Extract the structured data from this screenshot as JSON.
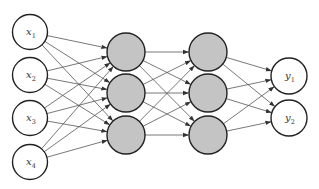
{
  "diagram": {
    "type": "feedforward-neural-network",
    "colors": {
      "background": "#ffffff",
      "edge": "#555555",
      "node_stroke": "#222222",
      "io_fill": "#ffffff",
      "hidden_fill": "#c4c4c4"
    },
    "layers": [
      {
        "name": "input",
        "x": 30,
        "r": 17.5,
        "fill": "io",
        "nodes": [
          {
            "y": 32,
            "label": "x",
            "sub": "1"
          },
          {
            "y": 75,
            "label": "x",
            "sub": "2"
          },
          {
            "y": 118,
            "label": "x",
            "sub": "3"
          },
          {
            "y": 162,
            "label": "x",
            "sub": "4"
          }
        ]
      },
      {
        "name": "hidden-1",
        "x": 126,
        "r": 19,
        "fill": "hidden",
        "nodes": [
          {
            "y": 52,
            "label": "",
            "sub": ""
          },
          {
            "y": 93,
            "label": "",
            "sub": ""
          },
          {
            "y": 135,
            "label": "",
            "sub": ""
          }
        ]
      },
      {
        "name": "hidden-2",
        "x": 208,
        "r": 19,
        "fill": "hidden",
        "nodes": [
          {
            "y": 52,
            "label": "",
            "sub": ""
          },
          {
            "y": 93,
            "label": "",
            "sub": ""
          },
          {
            "y": 135,
            "label": "",
            "sub": ""
          }
        ]
      },
      {
        "name": "output",
        "x": 289,
        "r": 18,
        "fill": "io",
        "nodes": [
          {
            "y": 76,
            "label": "y",
            "sub": "1"
          },
          {
            "y": 118,
            "label": "y",
            "sub": "2"
          }
        ]
      }
    ]
  }
}
